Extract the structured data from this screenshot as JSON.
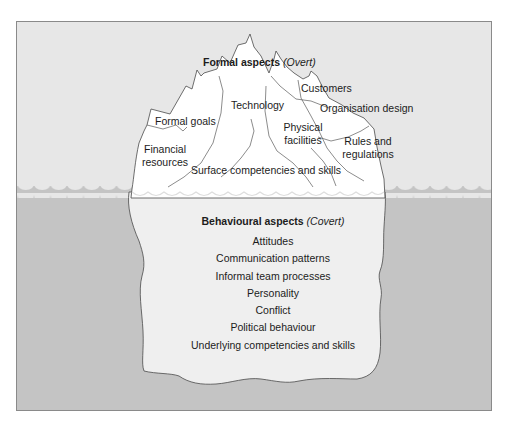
{
  "colors": {
    "sky": "#e7e7e7",
    "water": "#c4c4c4",
    "ice_above": "#ffffff",
    "ice_below": "#efefef",
    "outline": "#4a4a4a",
    "frame": "#8a8a8a"
  },
  "above_water": {
    "title_bold": "Formal aspects",
    "title_italic": "(Overt)",
    "items": [
      {
        "id": "customers",
        "text": "Customers"
      },
      {
        "id": "technology",
        "text": "Technology"
      },
      {
        "id": "organisation-design",
        "text": "Organisation design"
      },
      {
        "id": "formal-goals",
        "text": "Formal goals"
      },
      {
        "id": "physical-facilities",
        "line1": "Physical",
        "line2": "facilities"
      },
      {
        "id": "rules-and-regulations",
        "line1": "Rules and",
        "line2": "regulations"
      },
      {
        "id": "financial-resources",
        "line1": "Financial",
        "line2": "resources"
      },
      {
        "id": "surface-competencies",
        "text": "Surface competencies and skills"
      }
    ]
  },
  "below_water": {
    "title_bold": "Behavioural aspects",
    "title_italic": "(Covert)",
    "items": [
      "Attitudes",
      "Communication patterns",
      "Informal team processes",
      "Personality",
      "Conflict",
      "Political behaviour",
      "Underlying competencies and skills"
    ]
  }
}
